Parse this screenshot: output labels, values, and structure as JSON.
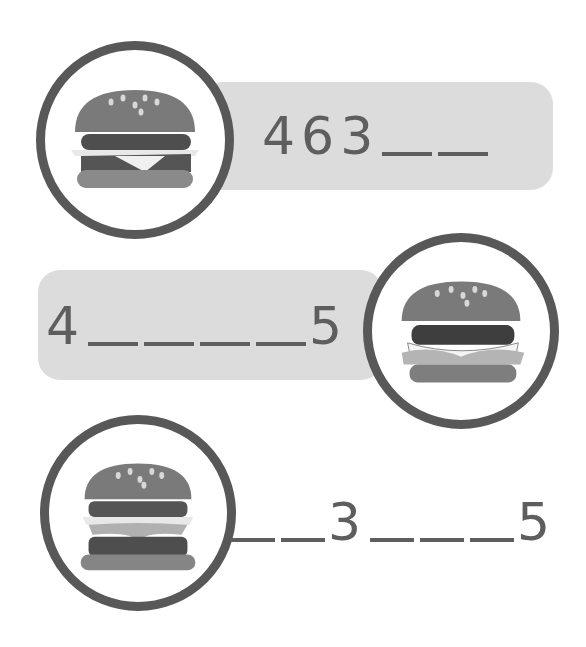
{
  "worksheet": {
    "rows": [
      {
        "id": "row-1",
        "icon": "burger-icon",
        "sequence": [
          {
            "type": "digit",
            "value": "4"
          },
          {
            "type": "digit",
            "value": "6"
          },
          {
            "type": "digit",
            "value": "3"
          },
          {
            "type": "blank"
          },
          {
            "type": "blank"
          }
        ],
        "box_visible": true
      },
      {
        "id": "row-2",
        "icon": "cheeseburger-icon",
        "sequence": [
          {
            "type": "digit",
            "value": "4"
          },
          {
            "type": "blank"
          },
          {
            "type": "blank"
          },
          {
            "type": "blank"
          },
          {
            "type": "blank"
          },
          {
            "type": "digit",
            "value": "5"
          }
        ],
        "box_visible": true
      },
      {
        "id": "row-3",
        "icon": "double-burger-icon",
        "sequence": [
          {
            "type": "blank"
          },
          {
            "type": "blank"
          },
          {
            "type": "digit",
            "value": "3"
          },
          {
            "type": "blank"
          },
          {
            "type": "blank"
          },
          {
            "type": "blank"
          },
          {
            "type": "digit",
            "value": "5"
          }
        ],
        "box_visible": false
      }
    ],
    "colors": {
      "ring": "#585858",
      "box": "#dcdcdc",
      "text": "#5e5e5e"
    }
  }
}
